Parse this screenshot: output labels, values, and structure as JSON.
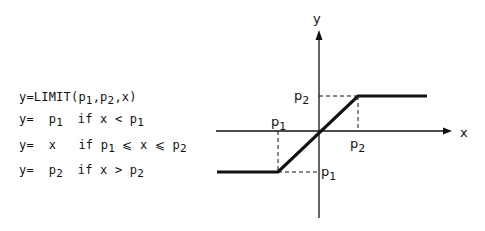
{
  "formulas": {
    "definition": {
      "prefix": "y=LIMIT(",
      "a": "p",
      "a_sub": "1",
      "sep1": ",",
      "b": "p",
      "b_sub": "2",
      "rest": ",x)"
    },
    "case1": {
      "lhs": "y=",
      "value": "p",
      "value_sub": "1",
      "cond": "if x < ",
      "cond_var": "p",
      "cond_sub": "1"
    },
    "case2": {
      "lhs": "y=",
      "value": "x",
      "cond_pre": "if ",
      "p1": "p",
      "p1_sub": "1",
      "mid": " ⩽ x ⩽ ",
      "p2": "p",
      "p2_sub": "2"
    },
    "case3": {
      "lhs": "y=",
      "value": "p",
      "value_sub": "2",
      "cond": "if x > ",
      "cond_var": "p",
      "cond_sub": "2"
    }
  },
  "diagram": {
    "x_axis_label": "x",
    "y_axis_label": "y",
    "labels": {
      "p2_y": {
        "main": "p",
        "sub": "2"
      },
      "p1_x": {
        "main": "p",
        "sub": "1"
      },
      "p2_x": {
        "main": "p",
        "sub": "2"
      },
      "p1_y": {
        "main": "p",
        "sub": "1"
      }
    },
    "line_color": "#111111"
  }
}
